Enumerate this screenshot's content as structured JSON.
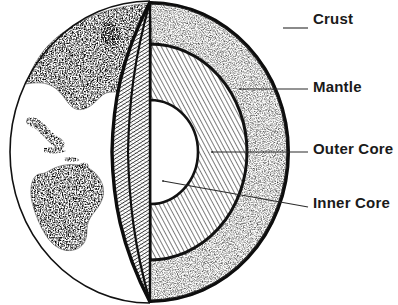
{
  "diagram": {
    "style": "pen-and-ink stipple and hatch illustration",
    "background_color": "#ffffff",
    "ink_color": "#1a1a1a",
    "labels": [
      {
        "id": "crust",
        "text": "Crust",
        "leader_from": [
          285,
          28
        ],
        "leader_to": [
          308,
          28
        ]
      },
      {
        "id": "mantle",
        "text": "Mantle",
        "leader_from": [
          240,
          89
        ],
        "leader_to": [
          308,
          89
        ]
      },
      {
        "id": "outer_core",
        "text": "Outer Core",
        "leader_from": [
          212,
          152
        ],
        "leader_to": [
          308,
          152
        ]
      },
      {
        "id": "inner_core",
        "text": "Inner Core",
        "leader_from": [
          163,
          181
        ],
        "leader_to": [
          308,
          207
        ]
      }
    ],
    "layers": [
      {
        "name": "Crust",
        "fill": "solid-black-band",
        "color": "#141414"
      },
      {
        "name": "Mantle",
        "fill": "stipple",
        "color": "#f2f2f0"
      },
      {
        "name": "Outer Core",
        "fill": "diagonal-hatch",
        "color": "#ffffff"
      },
      {
        "name": "Inner Core",
        "fill": "blank-white",
        "color": "#ffffff"
      }
    ],
    "surface": {
      "name": "Western Hemisphere surface",
      "features": [
        "North America",
        "Central America",
        "Caribbean islands",
        "South America"
      ],
      "fill": "stipple",
      "ocean_fill": "white"
    },
    "wedge": {
      "name": "cut wedge",
      "fill": "cross-hatch"
    }
  }
}
